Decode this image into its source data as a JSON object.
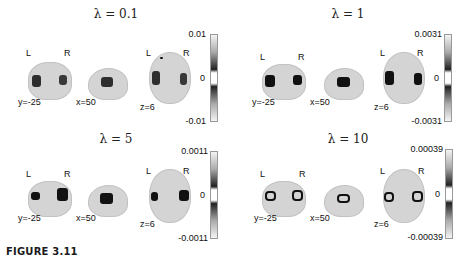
{
  "figure": {
    "caption": "FIGURE 3.11",
    "panels": [
      {
        "title": "λ = 0.1",
        "cbar_max": "0.01",
        "cbar_mid": "0",
        "cbar_min": "-0.01",
        "coronal_label": "y=-25",
        "sagittal_label": "x=50",
        "axial_label": "z=6",
        "left": "L",
        "right": "R"
      },
      {
        "title": "λ = 1",
        "cbar_max": "0.0031",
        "cbar_mid": "0",
        "cbar_min": "-0.0031",
        "coronal_label": "y=-25",
        "sagittal_label": "x=50",
        "axial_label": "z=6",
        "left": "L",
        "right": "R"
      },
      {
        "title": "λ = 5",
        "cbar_max": "0.0011",
        "cbar_mid": "0",
        "cbar_min": "-0.0011",
        "coronal_label": "y=-25",
        "sagittal_label": "x=50",
        "axial_label": "z=6",
        "left": "L",
        "right": "R"
      },
      {
        "title": "λ = 10",
        "cbar_max": "0.00039",
        "cbar_mid": "0",
        "cbar_min": "-0.00039",
        "coronal_label": "y=-25",
        "sagittal_label": "x=50",
        "axial_label": "z=6",
        "left": "L",
        "right": "R"
      }
    ]
  }
}
